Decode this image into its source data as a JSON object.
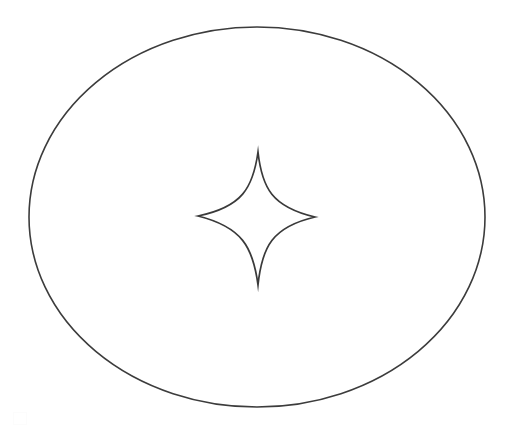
{
  "canvas": {
    "width": 507,
    "height": 426,
    "background_color": "#ffffff",
    "title": "Line drawing: four-pointed star inside an ellipse"
  },
  "style": {
    "stroke_color": "#3a3a3a",
    "ellipse_stroke_width": 1.6,
    "star_stroke_width": 1.7,
    "fill": "none"
  },
  "shapes": {
    "ellipse": {
      "name": "outer-ellipse",
      "center_x": 257,
      "center_y": 217,
      "radius_x": 228,
      "radius_y": 190,
      "stroke_color": "#3c3c3c",
      "stroke_width": 1.6,
      "fill": "none"
    },
    "star": {
      "name": "four-pointed-star",
      "kind": "astroid",
      "points": 4,
      "center_x": 257,
      "center_y": 218,
      "tip_top_x": 258,
      "tip_top_y": 152,
      "tip_bottom_x": 258,
      "tip_bottom_y": 285,
      "tip_left_x": 198,
      "tip_left_y": 216,
      "tip_right_x": 315,
      "tip_right_y": 217,
      "half_width": 58,
      "half_height": 67,
      "concavity": 0.42,
      "stroke_color": "#3a3a3a",
      "stroke_width": 1.7,
      "fill": "none",
      "path": "M 258 152 C 262 188 272 207 315 217 C 272 227 262 247 258 285 C 253 247 242 227 198 216 C 242 207 253 188 258 152 Z"
    },
    "artifact": {
      "name": "scan-artifact",
      "x": 13,
      "y": 412,
      "width": 12,
      "height": 11,
      "color": "#fcfcfc"
    }
  },
  "labels": {
    "caption": "",
    "annotations": []
  }
}
